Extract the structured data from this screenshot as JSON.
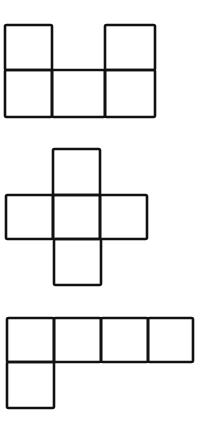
{
  "diagram": {
    "type": "cube-nets",
    "stroke_color": "#111111",
    "background": "#ffffff",
    "figures": [
      {
        "name": "net-1",
        "description": "Two squares on top at left and right ends over a row of three squares",
        "cells": [
          {
            "x": 5,
            "y": 25,
            "w": 47,
            "h": 45
          },
          {
            "x": 105,
            "y": 25,
            "w": 50,
            "h": 45
          },
          {
            "x": 5,
            "y": 70,
            "w": 47,
            "h": 47
          },
          {
            "x": 52,
            "y": 70,
            "w": 53,
            "h": 47
          },
          {
            "x": 105,
            "y": 70,
            "w": 50,
            "h": 47
          }
        ]
      },
      {
        "name": "net-2",
        "description": "Cross shape: one square above, row of three, one square below",
        "cells": [
          {
            "x": 53,
            "y": 149,
            "w": 47,
            "h": 46
          },
          {
            "x": 6,
            "y": 195,
            "w": 47,
            "h": 44
          },
          {
            "x": 53,
            "y": 195,
            "w": 47,
            "h": 44
          },
          {
            "x": 100,
            "y": 195,
            "w": 47,
            "h": 44
          },
          {
            "x": 54,
            "y": 239,
            "w": 47,
            "h": 46
          }
        ]
      },
      {
        "name": "net-3",
        "description": "Row of four squares with one square below the leftmost",
        "cells": [
          {
            "x": 7,
            "y": 318,
            "w": 47,
            "h": 44
          },
          {
            "x": 54,
            "y": 318,
            "w": 47,
            "h": 44
          },
          {
            "x": 101,
            "y": 318,
            "w": 47,
            "h": 44
          },
          {
            "x": 148,
            "y": 318,
            "w": 45,
            "h": 44
          },
          {
            "x": 7,
            "y": 362,
            "w": 47,
            "h": 46
          }
        ]
      }
    ]
  }
}
